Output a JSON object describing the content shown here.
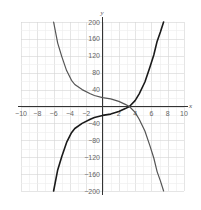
{
  "chart_data": {
    "type": "line",
    "title": "",
    "xlabel": "x",
    "ylabel": "y",
    "xlim": [
      -10,
      10
    ],
    "ylim": [
      -200,
      200
    ],
    "grid": true,
    "x_ticks": [
      -10,
      -8,
      -6,
      -4,
      -2,
      2,
      4,
      6,
      8,
      10
    ],
    "y_ticks": [
      200,
      160,
      120,
      80,
      40,
      -40,
      -80,
      -120,
      -160,
      -200
    ],
    "x_grid_step": 1,
    "y_grid_step": 20,
    "series": [
      {
        "name": "black curve (increasing)",
        "color": "#1a1a1a",
        "x": [
          -6,
          -5.5,
          -5,
          -4.4,
          -3.8,
          -3.4,
          -2.5,
          -1.5,
          -1,
          0,
          1,
          2,
          2.8,
          3.3,
          4,
          4.5,
          5.2,
          5.8,
          6.3,
          6.7,
          7.1,
          7.5
        ],
        "y": [
          -200,
          -150,
          -118,
          -85,
          -62,
          -52,
          -40,
          -30,
          -26,
          -21,
          -18,
          -12,
          -5,
          0,
          14,
          30,
          58,
          92,
          122,
          154,
          176,
          200
        ]
      },
      {
        "name": "gray curve (decreasing)",
        "color": "#555555",
        "x": [
          -6,
          -5.5,
          -5,
          -4.4,
          -3.8,
          -3.4,
          -2.5,
          -1.5,
          -1,
          0,
          1,
          2,
          2.8,
          3.3,
          4,
          4.5,
          5.2,
          5.8,
          6.3,
          6.7,
          7.1,
          7.5
        ],
        "y": [
          200,
          150,
          118,
          85,
          62,
          52,
          40,
          30,
          26,
          21,
          18,
          12,
          5,
          0,
          -14,
          -30,
          -58,
          -92,
          -122,
          -154,
          -176,
          -200
        ]
      }
    ]
  },
  "labels": {
    "x_axis": "x",
    "y_axis": "y"
  },
  "ticks": {
    "x": [
      "-10",
      "-8",
      "-6",
      "-4",
      "-2",
      "2",
      "4",
      "6",
      "8",
      "10"
    ],
    "y": [
      "200",
      "160",
      "120",
      "80",
      "40",
      "-40",
      "-80",
      "-120",
      "-160",
      "-200"
    ]
  }
}
